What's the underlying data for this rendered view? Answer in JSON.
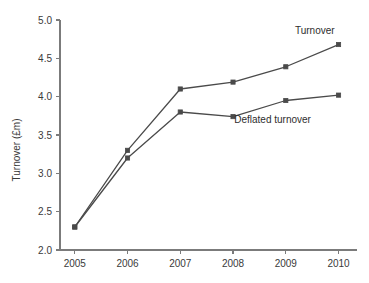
{
  "chart_data": {
    "type": "line",
    "title": "",
    "xlabel": "",
    "ylabel": "Turnover (£m)",
    "categories": [
      "2005",
      "2006",
      "2007",
      "2008",
      "2009",
      "2010"
    ],
    "x": [
      2005,
      2006,
      2007,
      2008,
      2009,
      2010
    ],
    "xlim": [
      2004.72,
      2010.35
    ],
    "ylim": [
      2.0,
      5.0
    ],
    "y_ticks": [
      "2.0",
      "2.5",
      "3.0",
      "3.5",
      "4.0",
      "4.5",
      "5.0"
    ],
    "y_tick_values": [
      2.0,
      2.5,
      3.0,
      3.5,
      4.0,
      4.5,
      5.0
    ],
    "grid": false,
    "legend_position": "inline-annotations",
    "series": [
      {
        "name": "Turnover",
        "values": [
          2.3,
          3.3,
          4.1,
          4.19,
          4.39,
          4.68
        ],
        "color": "#4a4a4a",
        "marker": "square",
        "label_text": "Turnover"
      },
      {
        "name": "Deflated turnover",
        "values": [
          2.3,
          3.2,
          3.8,
          3.74,
          3.95,
          4.02
        ],
        "color": "#4a4a4a",
        "marker": "square",
        "label_text": "Deflated turnover"
      }
    ],
    "annotations": [
      {
        "text": "Turnover",
        "x": 2009.55,
        "y": 4.82
      },
      {
        "text": "Deflated turnover",
        "x": 2008.75,
        "y": 3.66
      }
    ]
  },
  "style": {
    "background": "#ffffff",
    "axis_color": "#7b7b7b",
    "text_color": "#3a3a3a",
    "line_color": "#4a4a4a"
  }
}
